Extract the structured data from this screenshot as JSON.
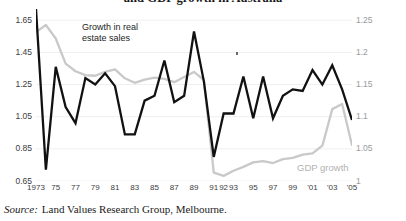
{
  "title": "and GDP growth in Australia",
  "source": {
    "label": "Source:",
    "text": "Land Values Research Group, Melbourne."
  },
  "annotations": {
    "real_estate": "Growth in real\nestate sales",
    "gdp": "GDP growth"
  },
  "colors": {
    "real_estate_line": "#111111",
    "gdp_line": "#c9c9c9",
    "gridline": "#efefef",
    "background": "#ffffff",
    "left_axis_text": "#3c3c3c",
    "right_axis_text": "#9a9a9a"
  },
  "chart_data": {
    "type": "line",
    "title": "and GDP growth in Australia",
    "xlabel": "",
    "ylabel": "",
    "grid": true,
    "legend": "inline-annotations",
    "x": [
      1973,
      1974,
      1975,
      1976,
      1977,
      1978,
      1979,
      1980,
      1981,
      1982,
      1983,
      1984,
      1985,
      1986,
      1987,
      1988,
      1989,
      1990,
      1991,
      1992,
      1993,
      1994,
      1995,
      1996,
      1997,
      1998,
      1999,
      2000,
      2001,
      2002,
      2003,
      2004,
      2005
    ],
    "xtick_labels": [
      "1973",
      "75",
      "77",
      "79",
      "81",
      "83",
      "85",
      "87",
      "89",
      "91",
      "92",
      "93",
      "95",
      "97",
      "99",
      "'01",
      "'03",
      "'05"
    ],
    "xtick_values": [
      1973,
      1975,
      1977,
      1979,
      1981,
      1983,
      1985,
      1987,
      1989,
      1991,
      1992,
      1993,
      1995,
      1997,
      1999,
      2001,
      2003,
      2005
    ],
    "left_axis": {
      "label": "Growth in real estate sales",
      "ticks": [
        0.65,
        0.85,
        1.05,
        1.25,
        1.45,
        1.65
      ],
      "tick_labels": [
        "0.65",
        "0.85",
        "1.05",
        "1.25",
        "1.45",
        "1.65"
      ],
      "ylim": [
        0.65,
        1.72
      ]
    },
    "right_axis": {
      "label": "GDP growth",
      "ticks": [
        1,
        1.05,
        1.1,
        1.15,
        1.2,
        1.25
      ],
      "tick_labels": [
        "1",
        "1.05",
        "1.1",
        "1.15",
        "1.2",
        "1.25"
      ],
      "ylim": [
        1.0,
        1.268
      ]
    },
    "series": [
      {
        "name": "Growth in real estate sales",
        "axis": "left",
        "color": "#111111",
        "values": [
          1.72,
          0.72,
          1.36,
          1.11,
          1.01,
          1.29,
          1.25,
          1.32,
          1.24,
          0.94,
          0.94,
          1.15,
          1.18,
          1.4,
          1.14,
          1.18,
          1.58,
          1.27,
          0.8,
          1.07,
          1.07,
          1.3,
          1.04,
          1.3,
          1.04,
          1.18,
          1.22,
          1.21,
          1.34,
          1.25,
          1.37,
          1.22,
          1.03
        ]
      },
      {
        "name": "GDP growth",
        "axis": "right",
        "color": "#c9c9c9",
        "values": [
          1.232,
          1.243,
          1.222,
          1.183,
          1.171,
          1.165,
          1.164,
          1.17,
          1.174,
          1.16,
          1.153,
          1.158,
          1.161,
          1.159,
          1.154,
          1.162,
          1.17,
          1.157,
          1.013,
          1.008,
          1.016,
          1.022,
          1.029,
          1.031,
          1.028,
          1.034,
          1.036,
          1.041,
          1.043,
          1.055,
          1.112,
          1.12,
          1.056
        ]
      }
    ]
  }
}
